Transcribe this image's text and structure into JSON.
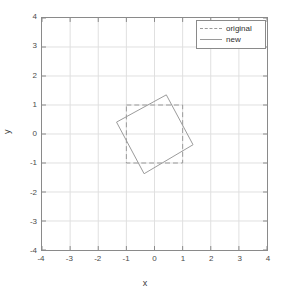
{
  "chart_data": {
    "type": "line",
    "title": "",
    "xlabel": "x",
    "ylabel": "y",
    "xlim": [
      -4,
      4
    ],
    "ylim": [
      -4,
      4
    ],
    "xticks": [
      "-4",
      "-3",
      "-2",
      "-1",
      "0",
      "1",
      "2",
      "3",
      "4"
    ],
    "yticks": [
      "4",
      "3",
      "2",
      "1",
      "0",
      "-1",
      "-2",
      "-3",
      "-4"
    ],
    "xtick_values": [
      -4,
      -3,
      -2,
      -1,
      0,
      1,
      2,
      3,
      4
    ],
    "ytick_values": [
      4,
      3,
      2,
      1,
      0,
      -1,
      -2,
      -3,
      -4
    ],
    "grid": true,
    "legend_position": "upper right",
    "series": [
      {
        "name": "original",
        "style": "dashed",
        "color": "#9a9a9a",
        "closed": true,
        "points": [
          [
            -1,
            1
          ],
          [
            1,
            1
          ],
          [
            1,
            -1
          ],
          [
            -1,
            -1
          ]
        ]
      },
      {
        "name": "new",
        "style": "solid",
        "color": "#9a9a9a",
        "closed": true,
        "points": [
          [
            0.42,
            1.35
          ],
          [
            1.37,
            -0.37
          ],
          [
            -0.37,
            -1.37
          ],
          [
            -1.35,
            0.41
          ]
        ]
      }
    ]
  },
  "legend": {
    "entries": [
      {
        "label": "original",
        "style": "dashed"
      },
      {
        "label": "new",
        "style": "solid"
      }
    ]
  },
  "axes": {
    "x_axis_label": "x",
    "y_axis_label": "y"
  },
  "colors": {
    "grid": "#e0e0e0",
    "axis": "#8a8a8a",
    "line": "#9a9a9a",
    "background": "#ffffff",
    "text": "#3a3a3a"
  }
}
